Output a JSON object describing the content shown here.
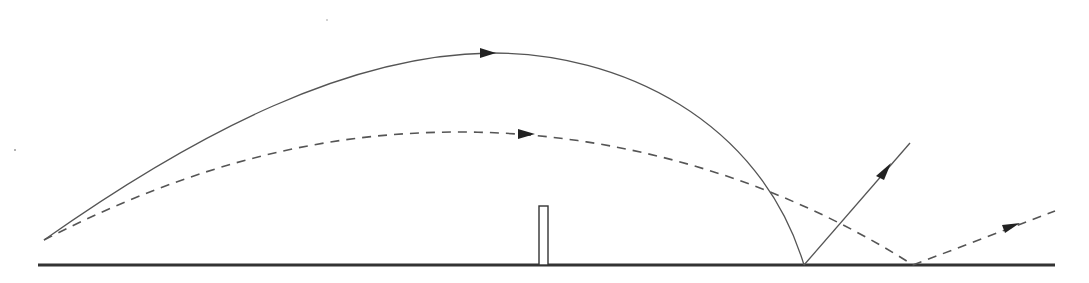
{
  "diagram": {
    "colors": {
      "background": "#ffffff",
      "line": "#555555",
      "ground": "#333333",
      "arrowhead": "#222222"
    },
    "ground": {
      "x1": 38,
      "x2": 1055,
      "y": 265
    },
    "post": {
      "x": 539,
      "y": 206,
      "width": 9,
      "height": 59
    },
    "launch_point": {
      "x": 44,
      "y": 240
    },
    "trajectories": [
      {
        "name": "high-trajectory",
        "style": "solid",
        "path": "M44,240 C200,130 350,55 490,53 C620,52 760,120 804,265",
        "arrow_direction": "right",
        "arrow_at": {
          "x": 490,
          "y": 53
        },
        "bounce_point": {
          "x": 804,
          "y": 265
        },
        "rebound": {
          "x1": 804,
          "y1": 265,
          "x2": 910,
          "y2": 143,
          "style": "solid",
          "arrow_at": {
            "x": 885,
            "y": 170
          }
        }
      },
      {
        "name": "low-trajectory",
        "style": "dashed",
        "path": "M44,240 C200,160 330,132 460,132 C620,132 780,180 913,265",
        "arrow_direction": "right",
        "arrow_at": {
          "x": 528,
          "y": 134
        },
        "bounce_point": {
          "x": 913,
          "y": 265
        },
        "rebound": {
          "x1": 913,
          "y1": 265,
          "x2": 1055,
          "y2": 211,
          "style": "dashed",
          "arrow_at": {
            "x": 1012,
            "y": 227
          }
        }
      }
    ],
    "intersection_points": [
      {
        "x": 757,
        "y": 185
      },
      {
        "x": 829,
        "y": 222
      }
    ]
  }
}
